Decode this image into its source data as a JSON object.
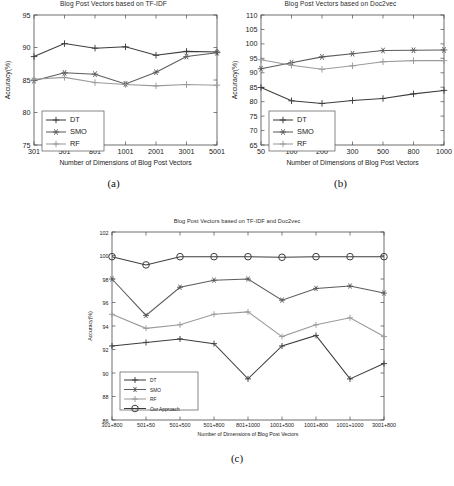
{
  "figure": {
    "panels": [
      {
        "id": "a",
        "sublabel": "(a)",
        "chart_data": {
          "type": "line",
          "title": "Blog Post Vectors based on TF-IDF",
          "xlabel": "Number of Dimensions of Blog Post Vectors",
          "ylabel": "Accuracy(%)",
          "categories": [
            "301",
            "501",
            "801",
            "1001",
            "2001",
            "3001",
            "5001"
          ],
          "ylim": [
            75,
            95
          ],
          "yticks": [
            75,
            80,
            85,
            90,
            95
          ],
          "grid": false,
          "legend_position": "lower-left",
          "series": [
            {
              "name": "DT",
              "marker": "plus",
              "color": "#3d3d3d",
              "values": [
                88.6,
                90.6,
                89.9,
                90.1,
                88.8,
                89.4,
                89.3
              ]
            },
            {
              "name": "SMO",
              "marker": "asterisk",
              "color": "#5c5c5c",
              "values": [
                84.9,
                86.1,
                85.9,
                84.4,
                86.2,
                88.6,
                89.2
              ]
            },
            {
              "name": "RF",
              "marker": "plus",
              "color": "#9a9a9a",
              "values": [
                85.1,
                85.4,
                84.6,
                84.3,
                84.1,
                84.3,
                84.2
              ]
            }
          ]
        }
      },
      {
        "id": "b",
        "sublabel": "(b)",
        "chart_data": {
          "type": "line",
          "title": "Blog Post Vectors based on Doc2vec",
          "xlabel": "Number of Dimensions of Blog Post Vectors",
          "ylabel": "Accuracy(%)",
          "categories": [
            "50",
            "100",
            "200",
            "300",
            "500",
            "800",
            "1000"
          ],
          "ylim": [
            65,
            110
          ],
          "yticks": [
            65,
            70,
            75,
            80,
            85,
            90,
            95,
            100,
            105,
            110
          ],
          "grid": false,
          "legend_position": "lower-left",
          "series": [
            {
              "name": "DT",
              "marker": "plus",
              "color": "#3d3d3d",
              "values": [
                84.9,
                80.3,
                79.4,
                80.4,
                81.1,
                82.7,
                83.9
              ]
            },
            {
              "name": "SMO",
              "marker": "asterisk",
              "color": "#5c5c5c",
              "values": [
                91.4,
                93.5,
                95.5,
                96.6,
                97.7,
                97.8,
                97.9
              ]
            },
            {
              "name": "RF",
              "marker": "plus",
              "color": "#9a9a9a",
              "values": [
                94.5,
                92.6,
                91.2,
                92.4,
                93.8,
                94.2,
                94.2
              ]
            }
          ]
        }
      },
      {
        "id": "c",
        "sublabel": "(c)",
        "chart_data": {
          "type": "line",
          "title": "Blog Post Vectors based on TF-IDF and Doc2vec",
          "xlabel": "Number of Dimensions of Blog Post Vectors",
          "ylabel": "Accuracy(%)",
          "categories": [
            "301+800",
            "501+50",
            "501+500",
            "501+800",
            "801+1000",
            "1001+500",
            "1001+800",
            "1001+1000",
            "3001+800"
          ],
          "ylim": [
            86,
            102
          ],
          "yticks": [
            86,
            88,
            90,
            92,
            94,
            96,
            98,
            100,
            102
          ],
          "grid": false,
          "legend_position": "lower-left",
          "series": [
            {
              "name": "DT",
              "marker": "plus",
              "color": "#3d3d3d",
              "values": [
                92.3,
                92.6,
                92.9,
                92.5,
                89.5,
                92.3,
                93.2,
                89.5,
                90.8
              ]
            },
            {
              "name": "SMO",
              "marker": "asterisk",
              "color": "#5c5c5c",
              "values": [
                98.0,
                94.9,
                97.3,
                97.9,
                98.0,
                96.2,
                97.2,
                97.4,
                96.8
              ]
            },
            {
              "name": "RF",
              "marker": "plus",
              "color": "#9a9a9a",
              "values": [
                95.0,
                93.8,
                94.1,
                95.0,
                95.2,
                93.1,
                94.1,
                94.7,
                93.1
              ]
            },
            {
              "name": "Our Approach",
              "marker": "circle",
              "color": "#3d3d3d",
              "values": [
                99.9,
                99.2,
                99.9,
                99.9,
                99.9,
                99.85,
                99.9,
                99.9,
                99.9
              ]
            }
          ]
        }
      }
    ]
  }
}
